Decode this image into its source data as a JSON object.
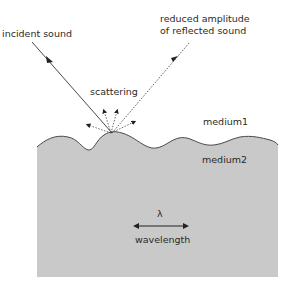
{
  "diagram": {
    "labels": {
      "incident": "incident sound",
      "reflected_line1": "reduced amplitude",
      "reflected_line2": "of reflected sound",
      "scattering": "scattering",
      "medium1": "medium1",
      "medium2": "medium2",
      "lambda": "λ",
      "wavelength": "wavelength"
    },
    "colors": {
      "medium2_fill": "#c9c9c9",
      "surface_line": "#4a4a4a",
      "ray": "#3a3a3a",
      "background": "#ffffff"
    },
    "icons": {
      "incident_arrow": "arrow-down-right",
      "reflected_arrow": "arrow-up-right",
      "scatter_arrows": "dotted-arrows-fan",
      "wavelength_arrow": "double-headed-arrow"
    }
  }
}
